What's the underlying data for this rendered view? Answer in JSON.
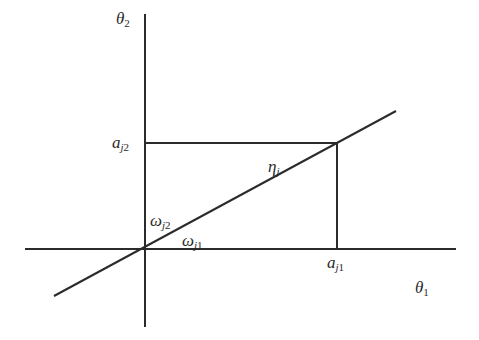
{
  "diagram": {
    "type": "vector-decomposition",
    "colors": {
      "line": "#2b2b2b",
      "text": "#2a2a2a",
      "background": "#ffffff"
    },
    "axes": {
      "x_axis": {
        "label_base": "θ",
        "label_sub": "1"
      },
      "y_axis": {
        "label_base": "θ",
        "label_sub": "2"
      }
    },
    "labels": {
      "theta1": {
        "base": "θ",
        "sub": "1"
      },
      "theta2": {
        "base": "θ",
        "sub": "2"
      },
      "aj1": {
        "base": "a",
        "sub_italic": "j",
        "sub": "1"
      },
      "aj2": {
        "base": "a",
        "sub_italic": "j",
        "sub": "2"
      },
      "eta_j": {
        "base": "η",
        "sub_italic": "j"
      },
      "omega_j1": {
        "base": "ω",
        "sub_italic": "j",
        "sub": "1"
      },
      "omega_j2": {
        "base": "ω",
        "sub_italic": "j",
        "sub": "2"
      }
    },
    "geometry": {
      "origin": [
        145,
        249
      ],
      "x_axis_extent": [
        25,
        456
      ],
      "y_axis_extent": [
        14,
        327
      ],
      "diagonal_line": {
        "from": [
          54,
          296
        ],
        "to": [
          396,
          111
        ]
      },
      "projection_point": [
        337,
        143
      ]
    }
  }
}
